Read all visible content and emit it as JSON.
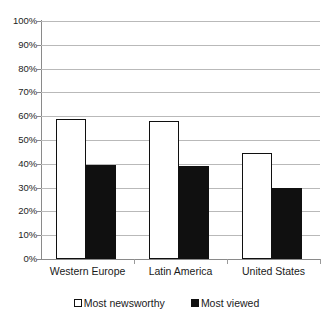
{
  "chart_data": {
    "type": "bar",
    "title": "",
    "subtitle": "",
    "xlabel": "",
    "ylabel": "",
    "ylim": [
      0,
      100
    ],
    "y_unit": "%",
    "grid": true,
    "legend_position": "bottom",
    "categories": [
      "Western Europe",
      "Latin America",
      "United States"
    ],
    "ytick_labels": [
      "100%",
      "90%",
      "80%",
      "70%",
      "60%",
      "50%",
      "40%",
      "30%",
      "20%",
      "10%",
      "0%"
    ],
    "ytick_values": [
      100,
      90,
      80,
      70,
      60,
      50,
      40,
      30,
      20,
      10,
      0
    ],
    "series": [
      {
        "name": "Most newsworthy",
        "swatch": "light",
        "values": [
          59,
          58,
          44.5
        ]
      },
      {
        "name": "Most viewed",
        "swatch": "dark",
        "values": [
          39.5,
          39,
          30
        ]
      }
    ],
    "colors": {
      "light_fill": "#ffffff",
      "dark_fill": "#101010",
      "bar_outline": "#101010",
      "gridline": "#b9b9b9",
      "axis": "#8a8a8a",
      "text": "#1a1a1a",
      "background": "#ffffff"
    }
  }
}
